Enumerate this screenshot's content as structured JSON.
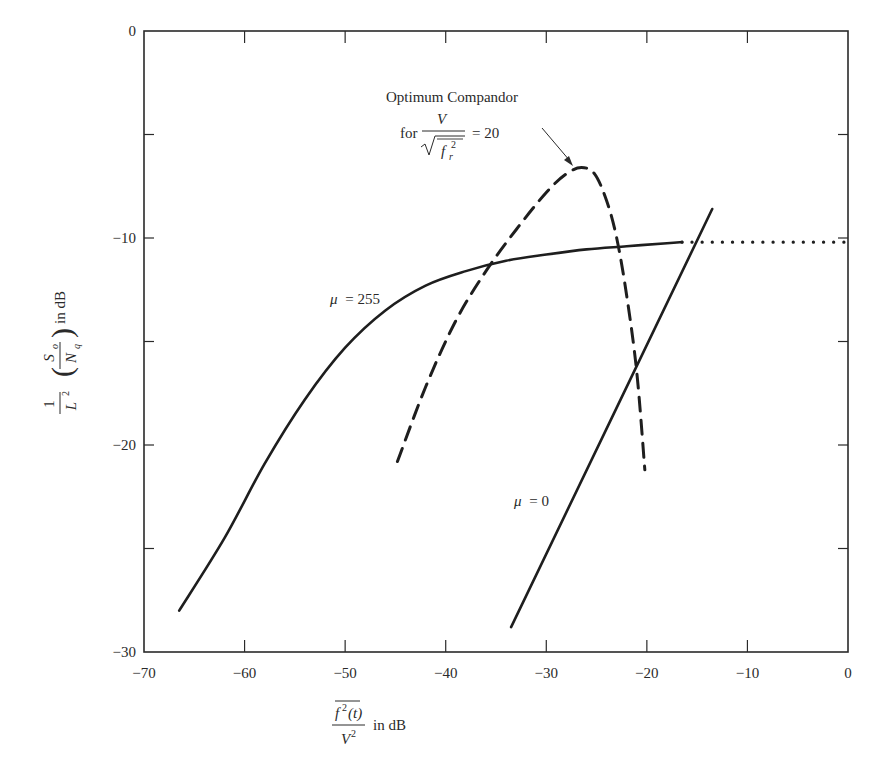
{
  "chart_data": {
    "type": "line",
    "title": "",
    "xlabel": "f²(t) / V² in dB",
    "xlabel_parts": {
      "numerator": "f²(t)",
      "denominator": "V²",
      "suffix": "in dB"
    },
    "ylabel": "(1/L²)(S_o/N_q) in dB",
    "ylabel_parts": {
      "frac_num": "1",
      "frac_den": "L²",
      "inner_num": "S_o",
      "inner_den": "N_q",
      "suffix": "in dB"
    },
    "xlim": [
      -70,
      0
    ],
    "ylim": [
      -30,
      0
    ],
    "xticks": [
      -70,
      -60,
      -50,
      -40,
      -30,
      -20,
      -10,
      0
    ],
    "yticks": [
      0,
      -10,
      -20,
      -30
    ],
    "xtick_labels": [
      "−70",
      "−60",
      "−50",
      "−40",
      "−30",
      "−20",
      "−10",
      "0"
    ],
    "ytick_labels": [
      "0",
      "−10",
      "−20",
      "−30"
    ],
    "grid": false,
    "legend": "none (inline labels)",
    "series": [
      {
        "name": "μ = 255",
        "style": "solid",
        "x": [
          -66.5,
          -62,
          -58,
          -54,
          -50,
          -46,
          -42,
          -38,
          -34,
          -30,
          -26,
          -22,
          -18,
          -16.5
        ],
        "y": [
          -28.0,
          -24.5,
          -20.9,
          -17.8,
          -15.3,
          -13.5,
          -12.3,
          -11.6,
          -11.1,
          -10.8,
          -10.55,
          -10.4,
          -10.25,
          -10.2
        ]
      },
      {
        "name": "μ = 255 (overload, dotted)",
        "style": "dotted",
        "x": [
          -16.5,
          0
        ],
        "y": [
          -10.2,
          -10.2
        ]
      },
      {
        "name": "μ = 0",
        "style": "solid",
        "x": [
          -33.5,
          -13.5
        ],
        "y": [
          -28.8,
          -8.6
        ]
      },
      {
        "name": "Optimum Compandor for V/√(f_r²) = 20",
        "style": "dashed",
        "x": [
          -44.8,
          -42,
          -39,
          -36,
          -33,
          -30,
          -28,
          -26.5,
          -25.2,
          -24,
          -23,
          -22,
          -21,
          -20.2
        ],
        "y": [
          -20.8,
          -17.2,
          -14.0,
          -11.6,
          -9.6,
          -7.8,
          -6.9,
          -6.6,
          -6.9,
          -8.2,
          -10.0,
          -12.8,
          -16.5,
          -21.2
        ]
      }
    ],
    "annotations": [
      {
        "text": "μ = 255",
        "x": -53,
        "y": -13.5
      },
      {
        "text": "μ = 0",
        "x": -30,
        "y": -23
      },
      {
        "text": "Optimum Compandor",
        "x": -28,
        "y": -3.3
      },
      {
        "text": "for V/√(f_r²) = 20",
        "x": -30,
        "y": -5.2,
        "arrow_to": [
          -26.4,
          -6.5
        ]
      }
    ]
  },
  "labels": {
    "mu255": "μ = 255",
    "mu0_sym": "μ",
    "mu0_val": "= 0",
    "mu255_sym": "μ",
    "mu255_val": "= 255",
    "opt_title": "Optimum Compandor",
    "opt_for": "for",
    "opt_V": "V",
    "opt_f": "f",
    "opt_r": "r",
    "opt_sq": "2",
    "opt_eq": "= 20",
    "x_num_f": "f",
    "x_num_sup": "2",
    "x_num_t": "(t)",
    "x_den_V": "V",
    "x_den_sup": "2",
    "x_suffix": "in dB",
    "y_one": "1",
    "y_L": "L",
    "y_L_sup": "2",
    "y_S": "S",
    "y_S_sub": "o",
    "y_N": "N",
    "y_N_sub": "q",
    "y_suffix": "in dB"
  }
}
